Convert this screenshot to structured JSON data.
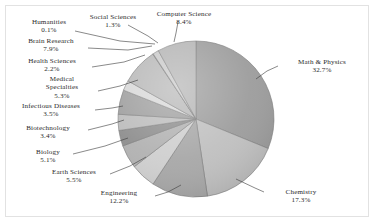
{
  "chart_data": {
    "type": "pie",
    "title": "",
    "subtitle": "",
    "xlabel": "",
    "ylabel": "",
    "legend_position": "none",
    "grid": false,
    "labels_show_percent": true,
    "start_angle_deg": 0,
    "direction": "clockwise",
    "categories": [
      "Math & Physics",
      "Chemistry",
      "Engineering",
      "Earth Sciences",
      "Biology",
      "Biotechnology",
      "Infectious Diseases",
      "Medical Specialties",
      "Health Sciences",
      "Brain Research",
      "Humanities",
      "Social Sciences",
      "Computer Science"
    ],
    "values": [
      32.7,
      17.3,
      12.2,
      5.5,
      5.1,
      3.4,
      3.5,
      5.3,
      2.2,
      7.9,
      0.1,
      1.3,
      8.4
    ],
    "unit": "%",
    "slice_colors": [
      "#9d9d9d",
      "#c0c0c0",
      "#a8a8a8",
      "#cfcfcf",
      "#b2b2b2",
      "#8f8f8f",
      "#bdbdbd",
      "#a0a0a0",
      "#d8d8d8",
      "#b8b8b8",
      "#909090",
      "#cacaca",
      "#b5b5b5"
    ],
    "slice_edge_color": "#7a7a7a",
    "background_color": "#ffffff",
    "frame_color": "#e2e2e2"
  },
  "labels": {
    "math_physics": {
      "name": "Math & Physics",
      "percent": "32.7%"
    },
    "chemistry": {
      "name": "Chemistry",
      "percent": "17.3%"
    },
    "engineering": {
      "name": "Engineering",
      "percent": "12.2%"
    },
    "earth_sciences": {
      "name": "Earth Sciences",
      "percent": "5.5%"
    },
    "biology": {
      "name": "Biology",
      "percent": "5.1%"
    },
    "biotechnology": {
      "name": "Biotechnology",
      "percent": "3.4%"
    },
    "infectious_diseases": {
      "name": "Infectious Diseases",
      "percent": "3.5%"
    },
    "medical_specialties": {
      "name1": "Medical",
      "name2": "Specialties",
      "percent": "5.3%"
    },
    "health_sciences": {
      "name": "Health Sciences",
      "percent": "2.2%"
    },
    "brain_research": {
      "name": "Brain Research",
      "percent": "7.9%"
    },
    "humanities": {
      "name": "Humanities",
      "percent": "0.1%"
    },
    "social_sciences": {
      "name": "Social Sciences",
      "percent": "1.3%"
    },
    "computer_science": {
      "name": "Computer Science",
      "percent": "8.4%"
    }
  }
}
